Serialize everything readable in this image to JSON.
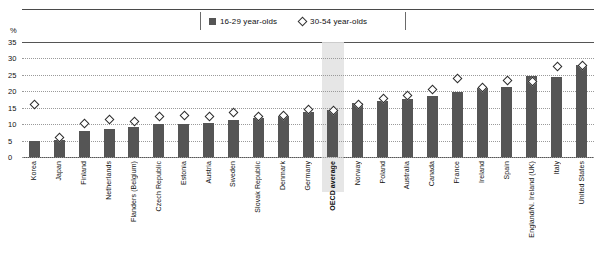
{
  "axis": {
    "unit_label": "%",
    "y_ticks": [
      0,
      5,
      10,
      15,
      20,
      25,
      30,
      35
    ],
    "y_min": 0,
    "y_max": 35
  },
  "legend": {
    "items": [
      {
        "label": "16-29 year-olds",
        "marker": "filled-square",
        "color": "#555555"
      },
      {
        "label": "30-54 year-olds",
        "marker": "open-diamond",
        "color": "#ffffff"
      }
    ]
  },
  "highlight": {
    "category": "OECD average",
    "color": "#e2e2e2"
  },
  "chart_data": {
    "type": "bar",
    "title": "",
    "xlabel": "",
    "ylabel": "%",
    "ylim": [
      0,
      35
    ],
    "grid": true,
    "legend_position": "top-center",
    "categories": [
      "Korea",
      "Japan",
      "Finland",
      "Netherlands",
      "Flanders (Belgium)",
      "Czech Republic",
      "Estonia",
      "Austria",
      "Sweden",
      "Slovak Republic",
      "Denmark",
      "Germany",
      "OECD average",
      "Norway",
      "Poland",
      "Australia",
      "Canada",
      "France",
      "Ireland",
      "Spain",
      "England/N. Ireland (UK)",
      "Italy",
      "United States"
    ],
    "series": [
      {
        "name": "16-29 year-olds",
        "type": "bar",
        "color": "#555555",
        "values": [
          5.0,
          5.2,
          8.0,
          8.6,
          9.2,
          10.2,
          10.2,
          10.4,
          11.4,
          12.0,
          12.6,
          13.8,
          14.4,
          16.4,
          17.0,
          17.6,
          18.6,
          19.8,
          21.0,
          21.4,
          24.6,
          24.4,
          28.0
        ]
      },
      {
        "name": "30-54 year-olds",
        "type": "scatter",
        "marker": "open-diamond",
        "color": "#ffffff",
        "values": [
          16.2,
          6.0,
          10.2,
          11.6,
          11.0,
          12.6,
          12.8,
          12.6,
          13.8,
          12.4,
          12.8,
          14.6,
          14.4,
          16.0,
          18.0,
          18.8,
          20.6,
          24.0,
          21.2,
          23.4,
          23.0,
          27.6,
          28.0
        ]
      }
    ]
  }
}
